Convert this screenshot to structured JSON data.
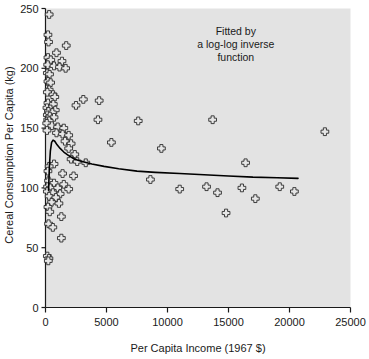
{
  "chart_data": {
    "type": "scatter",
    "title": "",
    "xlabel": "Per Capita Income (1967 $)",
    "ylabel": "Cereal Consumption Per Capita (kg)",
    "xlim": [
      0,
      25000
    ],
    "ylim": [
      0,
      250
    ],
    "xticks": [
      0,
      5000,
      10000,
      15000,
      20000,
      25000
    ],
    "xtick_labels": [
      "0",
      "5000",
      "10000",
      "15000",
      "20000",
      "25000"
    ],
    "yticks": [
      0,
      50,
      100,
      150,
      200,
      250
    ],
    "ytick_labels": [
      "0",
      "50",
      "100",
      "150",
      "200",
      "250"
    ],
    "grid": false,
    "legend": null,
    "annotations": [
      {
        "name": "fit-annotation",
        "lines": [
          "Fitted by",
          "a log-log inverse",
          "function"
        ],
        "x": 15600,
        "y": 228,
        "align": "center"
      }
    ],
    "marker": {
      "style": "open-cross-circle",
      "size": 5,
      "edge_color": "#2b2b2b",
      "face_color": "#e6e6e6"
    },
    "plot_background": "#e3e3e3",
    "figure_background": "#ffffff",
    "fit_curve": {
      "name": "log-log inverse fit",
      "color": "#000000",
      "width": 1.6,
      "x": [
        250,
        320,
        400,
        500,
        620,
        760,
        950,
        1200,
        1500,
        1900,
        2400,
        3000,
        3800,
        4800,
        6000,
        7500,
        9000,
        11000,
        13000,
        15000,
        17000,
        19000,
        20700
      ],
      "y": [
        98,
        118,
        131,
        138,
        140,
        139,
        136,
        133,
        130,
        127,
        124,
        122,
        120,
        118,
        116,
        114,
        113,
        112,
        111,
        110,
        109,
        108.5,
        108
      ]
    },
    "points": [
      {
        "x": 300,
        "y": 245
      },
      {
        "x": 200,
        "y": 228
      },
      {
        "x": 250,
        "y": 222
      },
      {
        "x": 1700,
        "y": 219
      },
      {
        "x": 900,
        "y": 213
      },
      {
        "x": 200,
        "y": 209
      },
      {
        "x": 430,
        "y": 207
      },
      {
        "x": 1350,
        "y": 206
      },
      {
        "x": 180,
        "y": 203
      },
      {
        "x": 700,
        "y": 202
      },
      {
        "x": 1150,
        "y": 201
      },
      {
        "x": 1650,
        "y": 200
      },
      {
        "x": 150,
        "y": 196
      },
      {
        "x": 330,
        "y": 195
      },
      {
        "x": 200,
        "y": 189
      },
      {
        "x": 420,
        "y": 188
      },
      {
        "x": 300,
        "y": 182
      },
      {
        "x": 150,
        "y": 180
      },
      {
        "x": 620,
        "y": 178
      },
      {
        "x": 760,
        "y": 176
      },
      {
        "x": 3100,
        "y": 174
      },
      {
        "x": 4400,
        "y": 173
      },
      {
        "x": 200,
        "y": 171
      },
      {
        "x": 640,
        "y": 170
      },
      {
        "x": 2500,
        "y": 169
      },
      {
        "x": 120,
        "y": 167
      },
      {
        "x": 400,
        "y": 166
      },
      {
        "x": 800,
        "y": 165
      },
      {
        "x": 240,
        "y": 164
      },
      {
        "x": 560,
        "y": 163
      },
      {
        "x": 150,
        "y": 161
      },
      {
        "x": 350,
        "y": 160
      },
      {
        "x": 700,
        "y": 159
      },
      {
        "x": 180,
        "y": 157
      },
      {
        "x": 300,
        "y": 156
      },
      {
        "x": 100,
        "y": 154
      },
      {
        "x": 520,
        "y": 152
      },
      {
        "x": 1000,
        "y": 151
      },
      {
        "x": 1500,
        "y": 150
      },
      {
        "x": 4300,
        "y": 157
      },
      {
        "x": 7600,
        "y": 156
      },
      {
        "x": 13700,
        "y": 157
      },
      {
        "x": 22900,
        "y": 147
      },
      {
        "x": 120,
        "y": 148
      },
      {
        "x": 900,
        "y": 146
      },
      {
        "x": 1400,
        "y": 145
      },
      {
        "x": 1900,
        "y": 144
      },
      {
        "x": 1600,
        "y": 139
      },
      {
        "x": 2100,
        "y": 137
      },
      {
        "x": 1900,
        "y": 133
      },
      {
        "x": 9500,
        "y": 133
      },
      {
        "x": 5400,
        "y": 138
      },
      {
        "x": 2400,
        "y": 128
      },
      {
        "x": 2100,
        "y": 124
      },
      {
        "x": 2600,
        "y": 122
      },
      {
        "x": 3300,
        "y": 121
      },
      {
        "x": 16400,
        "y": 121
      },
      {
        "x": 700,
        "y": 120
      },
      {
        "x": 300,
        "y": 118
      },
      {
        "x": 200,
        "y": 114
      },
      {
        "x": 1400,
        "y": 112
      },
      {
        "x": 2300,
        "y": 110
      },
      {
        "x": 8600,
        "y": 107
      },
      {
        "x": 250,
        "y": 106
      },
      {
        "x": 700,
        "y": 104
      },
      {
        "x": 1500,
        "y": 103
      },
      {
        "x": 170,
        "y": 101
      },
      {
        "x": 400,
        "y": 100
      },
      {
        "x": 1000,
        "y": 100
      },
      {
        "x": 1900,
        "y": 99
      },
      {
        "x": 150,
        "y": 97
      },
      {
        "x": 600,
        "y": 96
      },
      {
        "x": 1200,
        "y": 95
      },
      {
        "x": 300,
        "y": 93
      },
      {
        "x": 850,
        "y": 92
      },
      {
        "x": 11000,
        "y": 99
      },
      {
        "x": 13200,
        "y": 101
      },
      {
        "x": 16100,
        "y": 100
      },
      {
        "x": 19200,
        "y": 101
      },
      {
        "x": 20400,
        "y": 97
      },
      {
        "x": 17200,
        "y": 91
      },
      {
        "x": 14800,
        "y": 79
      },
      {
        "x": 14100,
        "y": 96
      },
      {
        "x": 500,
        "y": 88
      },
      {
        "x": 1100,
        "y": 87
      },
      {
        "x": 200,
        "y": 84
      },
      {
        "x": 350,
        "y": 80
      },
      {
        "x": 1300,
        "y": 76
      },
      {
        "x": 250,
        "y": 70
      },
      {
        "x": 600,
        "y": 67
      },
      {
        "x": 1300,
        "y": 58
      },
      {
        "x": 150,
        "y": 43
      },
      {
        "x": 280,
        "y": 41
      },
      {
        "x": 230,
        "y": 39
      }
    ]
  }
}
